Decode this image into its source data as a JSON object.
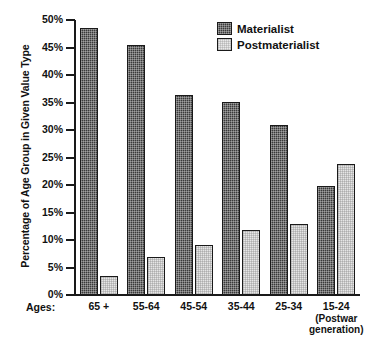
{
  "chart_data": {
    "type": "bar",
    "title": "",
    "xlabel": "Ages:",
    "ylabel": "Percentage of Age Group in Given Value Type",
    "ylim": [
      0,
      50
    ],
    "ytick_labels": [
      "50%",
      "45%",
      "40%",
      "35%",
      "30%",
      "25%",
      "20%",
      "15%",
      "10%",
      "5%",
      "0%"
    ],
    "ytick_values": [
      50,
      45,
      40,
      35,
      30,
      25,
      20,
      15,
      10,
      5,
      0
    ],
    "grid": false,
    "legend_position": "top-right",
    "categories": [
      "65 +",
      "55-64",
      "45-54",
      "35-44",
      "25-34",
      "15-24"
    ],
    "category_sublabels": [
      "",
      "",
      "",
      "",
      "",
      "(Postwar\ngeneration)"
    ],
    "series": [
      {
        "name": "Materialist",
        "values": [
          48.5,
          45.4,
          36.3,
          35.1,
          31.0,
          19.8
        ]
      },
      {
        "name": "Postmaterialist",
        "values": [
          3.4,
          6.9,
          9.1,
          11.9,
          13.0,
          23.9
        ]
      }
    ]
  },
  "axis": {
    "x_prefix_label": "Ages:",
    "y_title": "Percentage of Age Group in Given Value Type"
  },
  "legend": {
    "items": [
      {
        "label": "Materialist",
        "swatch": "materialist-swatch-icon",
        "color": "#3a3a3a"
      },
      {
        "label": "Postmaterialist",
        "swatch": "postmaterialist-swatch-icon",
        "color": "#e6e6e6"
      }
    ]
  },
  "categories": [
    {
      "label": "65 +",
      "sub": ""
    },
    {
      "label": "55-64",
      "sub": ""
    },
    {
      "label": "45-54",
      "sub": ""
    },
    {
      "label": "35-44",
      "sub": ""
    },
    {
      "label": "25-34",
      "sub": ""
    },
    {
      "label": "15-24",
      "sub_line1": "(Postwar",
      "sub_line2": "generation)"
    }
  ],
  "yticks": [
    {
      "label": "50%",
      "value": 50
    },
    {
      "label": "45%",
      "value": 45
    },
    {
      "label": "40%",
      "value": 40
    },
    {
      "label": "35%",
      "value": 35
    },
    {
      "label": "30%",
      "value": 30
    },
    {
      "label": "25%",
      "value": 25
    },
    {
      "label": "20%",
      "value": 20
    },
    {
      "label": "15%",
      "value": 15
    },
    {
      "label": "10%",
      "value": 10
    },
    {
      "label": "5%",
      "value": 5
    },
    {
      "label": "0%",
      "value": 0
    }
  ]
}
